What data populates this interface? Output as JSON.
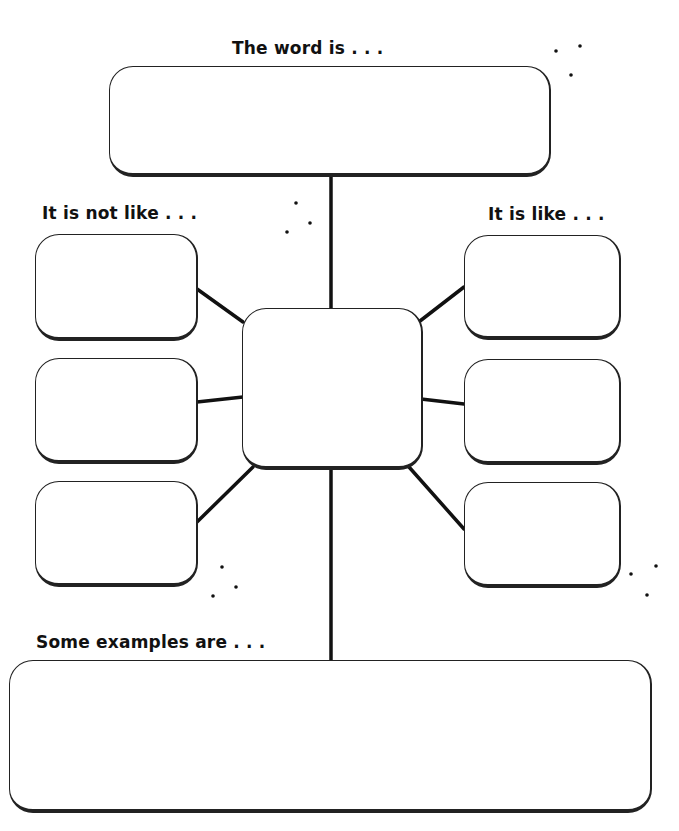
{
  "worksheet": {
    "labels": {
      "word": "The word is . . .",
      "not_like": "It is not like . . .",
      "like": "It is like . . .",
      "examples": "Some examples are . . ."
    },
    "boxes": {
      "word": "",
      "center": "",
      "not_like": [
        "",
        "",
        ""
      ],
      "like": [
        "",
        "",
        ""
      ],
      "examples": ""
    }
  }
}
